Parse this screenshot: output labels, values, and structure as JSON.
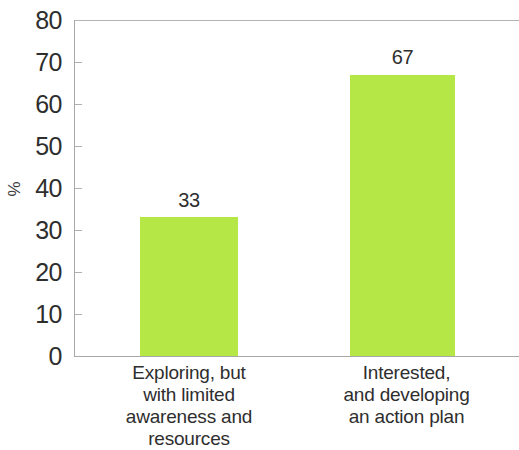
{
  "chart_data": {
    "type": "bar",
    "title": "",
    "subtitle": "",
    "xlabel": "",
    "ylabel": "%",
    "ylim": [
      0,
      80
    ],
    "ytick_step": 10,
    "yticks": [
      "80",
      "70",
      "60",
      "50",
      "40",
      "30",
      "20",
      "10",
      "0"
    ],
    "grid": false,
    "legend": "none",
    "bar_color": "#b5e847",
    "categories": [
      "Exploring, but with limited awareness and resources",
      "Interested, and developing an action plan"
    ],
    "category_lines": [
      [
        "Exploring, but",
        "with limited",
        "awareness and",
        "resources"
      ],
      [
        "Interested,",
        "and developing",
        "an action plan"
      ]
    ],
    "values": [
      33,
      67
    ],
    "value_labels": [
      "33",
      "67"
    ]
  },
  "axes": {
    "y_title": "%"
  }
}
